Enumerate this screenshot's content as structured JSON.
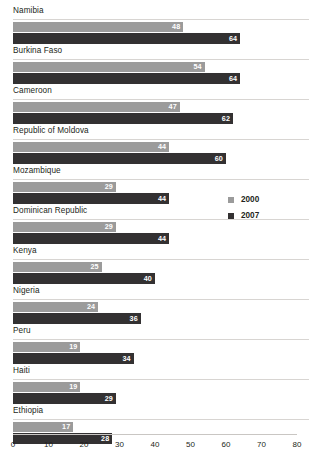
{
  "chart_data": {
    "type": "bar",
    "orientation": "horizontal",
    "title": "",
    "subtitle": "",
    "xlabel": "",
    "ylabel": "",
    "xlim": [
      0,
      80
    ],
    "xticks": [
      0,
      10,
      20,
      30,
      40,
      50,
      60,
      70,
      80
    ],
    "xtick_labels": [
      "0",
      "10",
      "20",
      "30",
      "40",
      "50",
      "60",
      "70",
      "80"
    ],
    "grid": false,
    "legend_position": "right",
    "categories": [
      "Namibia",
      "Burkina Faso",
      "Cameroon",
      "Republic of Moldova",
      "Mozambique",
      "Dominican Republic",
      "Kenya",
      "Nigeria",
      "Peru",
      "Haiti",
      "Ethiopia"
    ],
    "series": [
      {
        "name": "2000",
        "color": "#9b9b9b",
        "values": [
          48,
          54,
          47,
          44,
          29,
          29,
          25,
          24,
          19,
          19,
          17
        ]
      },
      {
        "name": "2007",
        "color": "#333132",
        "values": [
          64,
          64,
          62,
          60,
          44,
          44,
          40,
          36,
          34,
          29,
          28
        ]
      }
    ]
  },
  "legend": {
    "items": [
      {
        "label": "2000",
        "color": "#9b9b9b"
      },
      {
        "label": "2007",
        "color": "#333132"
      }
    ]
  },
  "colors": {
    "series_2000": "#9b9b9b",
    "series_2007": "#333132",
    "axis_line": "#c9c6c3",
    "rule": "#d8d5d2",
    "text": "#231f20",
    "value_text": "#ffffff",
    "background": "#ffffff"
  }
}
